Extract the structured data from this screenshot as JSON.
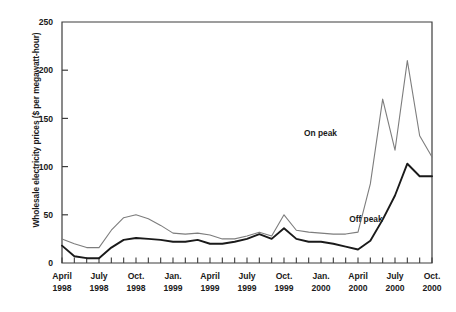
{
  "chart_data": {
    "type": "line",
    "title": "",
    "xlabel": "",
    "ylabel": "Wholesale electricity prices ($ per megawatt-hour)",
    "ylim": [
      0,
      250
    ],
    "yticks": [
      0,
      50,
      100,
      150,
      200,
      250
    ],
    "ytick_labels": [
      "0",
      "50",
      "100",
      "150",
      "200",
      "250"
    ],
    "grid": false,
    "legend_position": "inline-annotations",
    "x": [
      "April 1998",
      "May 1998",
      "June 1998",
      "July 1998",
      "Aug. 1998",
      "Sept. 1998",
      "Oct. 1998",
      "Nov. 1998",
      "Dec. 1998",
      "Jan. 1999",
      "Feb. 1999",
      "March 1999",
      "April 1999",
      "May 1999",
      "June 1999",
      "July 1999",
      "Aug. 1999",
      "Sept. 1999",
      "Oct. 1999",
      "Nov. 1999",
      "Dec. 1999",
      "Jan. 2000",
      "Feb. 2000",
      "March 2000",
      "April 2000",
      "May 2000",
      "June 2000",
      "July 2000",
      "Aug. 2000",
      "Sept. 2000",
      "Oct. 2000"
    ],
    "xtick_labels": [
      {
        "line1": "April",
        "line2": "1998",
        "index": 0
      },
      {
        "line1": "July",
        "line2": "1998",
        "index": 3
      },
      {
        "line1": "Oct.",
        "line2": "1998",
        "index": 6
      },
      {
        "line1": "Jan.",
        "line2": "1999",
        "index": 9
      },
      {
        "line1": "April",
        "line2": "1999",
        "index": 12
      },
      {
        "line1": "July",
        "line2": "1999",
        "index": 15
      },
      {
        "line1": "Oct.",
        "line2": "1999",
        "index": 18
      },
      {
        "line1": "Jan.",
        "line2": "2000",
        "index": 21
      },
      {
        "line1": "April",
        "line2": "2000",
        "index": 24
      },
      {
        "line1": "July",
        "line2": "2000",
        "index": 27
      },
      {
        "line1": "Oct.",
        "line2": "2000",
        "index": 30
      }
    ],
    "series": [
      {
        "name": "On peak",
        "color": "#7d7d7d",
        "label_x_index": 22.3,
        "label_y_value": 132,
        "values": [
          25,
          20,
          16,
          16,
          34,
          47,
          50,
          46,
          39,
          31,
          30,
          31,
          29,
          25,
          25,
          28,
          32,
          28,
          50,
          34,
          32,
          31,
          30,
          30,
          32,
          82,
          170,
          117,
          210,
          132,
          110
        ]
      },
      {
        "name": "Off peak",
        "color": "#1a1a1a",
        "label_x_index": 26.0,
        "label_y_value": 43,
        "values": [
          18,
          7,
          5,
          5,
          16,
          24,
          26,
          25,
          24,
          22,
          22,
          24,
          20,
          20,
          22,
          25,
          30,
          25,
          36,
          25,
          22,
          22,
          20,
          17,
          14,
          23,
          45,
          70,
          103,
          90,
          90
        ]
      }
    ]
  },
  "axes": {
    "frame_color": "#3d3d3d"
  }
}
